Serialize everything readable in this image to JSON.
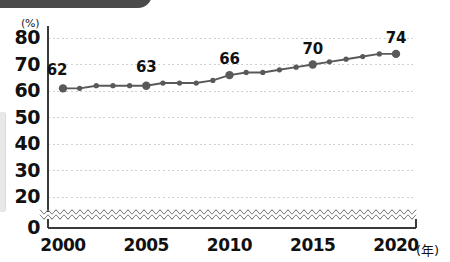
{
  "chart_data": {
    "type": "line",
    "title": "",
    "subtitle": "",
    "xlabel": "(年)",
    "ylabel": "(%)",
    "x": [
      2000,
      2001,
      2002,
      2003,
      2004,
      2005,
      2006,
      2007,
      2008,
      2009,
      2010,
      2011,
      2012,
      2013,
      2014,
      2015,
      2016,
      2017,
      2018,
      2019,
      2020
    ],
    "values": [
      61,
      61,
      62,
      62,
      62,
      62,
      63,
      63,
      63,
      64,
      66,
      67,
      67,
      68,
      69,
      70,
      71,
      72,
      73,
      74,
      74
    ],
    "series": [
      {
        "name": "",
        "values": [
          61,
          61,
          62,
          62,
          62,
          62,
          63,
          63,
          63,
          64,
          66,
          67,
          67,
          68,
          69,
          70,
          71,
          72,
          73,
          74,
          74
        ]
      }
    ],
    "point_labels": [
      {
        "x": 2000,
        "value": 62,
        "text": "62"
      },
      {
        "x": 2005,
        "value": 63,
        "text": "63"
      },
      {
        "x": 2010,
        "value": 66,
        "text": "66"
      },
      {
        "x": 2015,
        "value": 70,
        "text": "70"
      },
      {
        "x": 2020,
        "value": 74,
        "text": "74"
      }
    ],
    "y_ticks": [
      0,
      20,
      30,
      40,
      50,
      60,
      70,
      80
    ],
    "y_tick_labels": [
      "0",
      "20",
      "30",
      "40",
      "50",
      "60",
      "70",
      "80"
    ],
    "x_ticks": [
      2000,
      2005,
      2010,
      2015,
      2020
    ],
    "x_tick_labels": [
      "2000",
      "2005",
      "2010",
      "2015",
      "2020"
    ],
    "ylim": [
      0,
      85
    ],
    "xlim": [
      2000,
      2020
    ],
    "axis_break": true,
    "axis_break_between": [
      0,
      20
    ],
    "grid": true,
    "grid_style": "dotted-horizontal",
    "legend": "none",
    "colors": {
      "line": "#595959",
      "marker": "#595959",
      "grid": "#d0d0d0",
      "axis": "#3a3a3a",
      "text": "#111111",
      "banner": "#4a4a4a",
      "background": "#ffffff"
    }
  },
  "axis": {
    "y_unit": "(%)",
    "x_unit": "(年)"
  }
}
